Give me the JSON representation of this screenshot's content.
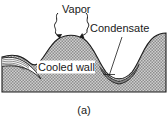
{
  "figure": {
    "caption": "(a)",
    "labels": {
      "vapor": "Vapor",
      "condensate": "Condensate",
      "cooled_wall": "Cooled wall"
    },
    "colors": {
      "background": "#ffffff",
      "wall_fill": "#b0b0b0",
      "wall_stroke": "#1c1c1c",
      "text": "#1a1a1a",
      "film_fill": "#ffffff",
      "film_stroke": "#2a2a2a"
    },
    "icons": {
      "vapor_arrow_left": "wavy-arrow-icon",
      "vapor_arrow_right": "wavy-arrow-icon",
      "condensate_leader": "leader-line-icon"
    },
    "description": {
      "subject": "Film condensation on a wavy cooled wall",
      "wall_profile": "two rounded crests with valleys between",
      "film_location": "condensate collects in the valleys as thin layered film"
    }
  }
}
